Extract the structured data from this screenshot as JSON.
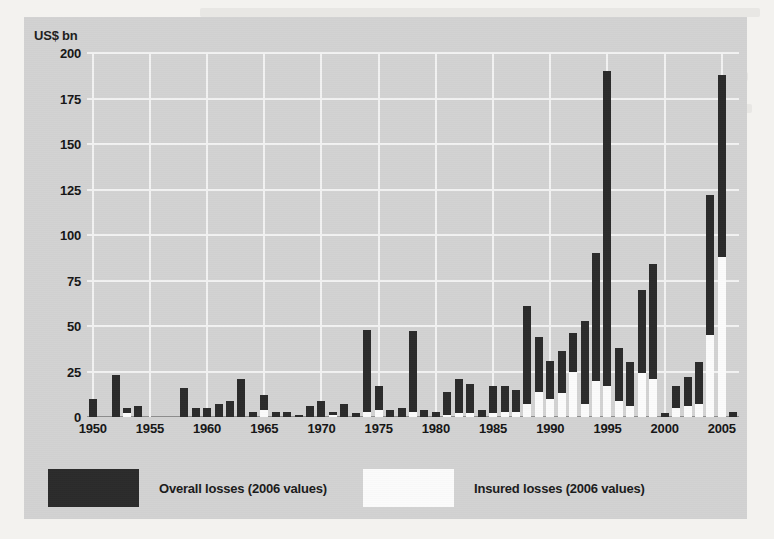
{
  "figure": {
    "y_unit_label": "US$ bn",
    "legend": [
      {
        "key": "overall",
        "label": "Overall losses (2006 values)",
        "color": "#2b2b2b"
      },
      {
        "key": "insured",
        "label": "Insured losses (2006 values)",
        "color": "#fbfbfb"
      }
    ],
    "panel_color": "#d2d2d2",
    "gridline_color": "#f2f2f2"
  },
  "chart_data": {
    "type": "bar",
    "title": "",
    "xlabel": "",
    "ylabel": "US$ bn",
    "ylim": [
      0,
      200
    ],
    "yticks": [
      0,
      25,
      50,
      75,
      100,
      125,
      150,
      175,
      200
    ],
    "xticks": [
      1950,
      1955,
      1960,
      1965,
      1970,
      1975,
      1980,
      1985,
      1990,
      1995,
      2000,
      2005
    ],
    "xlim": [
      1949.5,
      2006.5
    ],
    "grid": true,
    "legend_position": "bottom",
    "stacked": true,
    "categories": [
      1950,
      1951,
      1952,
      1953,
      1954,
      1955,
      1956,
      1957,
      1958,
      1959,
      1960,
      1961,
      1962,
      1963,
      1964,
      1965,
      1966,
      1967,
      1968,
      1969,
      1970,
      1971,
      1972,
      1973,
      1974,
      1975,
      1976,
      1977,
      1978,
      1979,
      1980,
      1981,
      1982,
      1983,
      1984,
      1985,
      1986,
      1987,
      1988,
      1989,
      1990,
      1991,
      1992,
      1993,
      1994,
      1995,
      1996,
      1997,
      1998,
      1999,
      2000,
      2001,
      2002,
      2003,
      2004,
      2005,
      2006
    ],
    "series": [
      {
        "name": "Overall losses (2006 values)",
        "color": "#2b2b2b",
        "values": [
          10,
          0,
          23,
          5,
          6,
          0,
          0,
          0,
          16,
          5,
          5,
          7,
          9,
          21,
          3,
          12,
          3,
          3,
          1,
          6,
          9,
          3,
          7,
          2,
          48,
          17,
          4,
          5,
          47,
          4,
          3,
          14,
          21,
          18,
          4,
          17,
          17,
          15,
          61,
          44,
          31,
          36,
          46,
          53,
          90,
          190,
          38,
          30,
          70,
          84,
          2,
          17,
          22,
          30,
          122,
          188,
          3
        ]
      },
      {
        "name": "Insured losses (2006 values)",
        "color": "#fbfbfb",
        "values": [
          0,
          0,
          0,
          2,
          0,
          0,
          0,
          0,
          0,
          0,
          0,
          0,
          0,
          0,
          0,
          4,
          0,
          0,
          0,
          0,
          0,
          1,
          0,
          0,
          3,
          4,
          0,
          0,
          3,
          0,
          0,
          1,
          2,
          2,
          0,
          2,
          3,
          3,
          7,
          14,
          10,
          13,
          25,
          7,
          20,
          17,
          9,
          6,
          24,
          21,
          0,
          5,
          6,
          7,
          45,
          88,
          0
        ]
      }
    ]
  }
}
